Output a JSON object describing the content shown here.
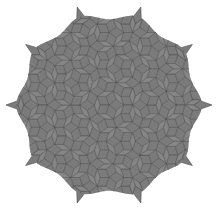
{
  "figure": {
    "background": "#ffffff",
    "tile_fill": "#7b7b7b",
    "tile_fill_alt": "#868686",
    "edge_color": "#4e4e4e",
    "center": [
      109,
      105
    ],
    "radius": 92,
    "symmetry": 10,
    "tile_edge_length": 9
  }
}
